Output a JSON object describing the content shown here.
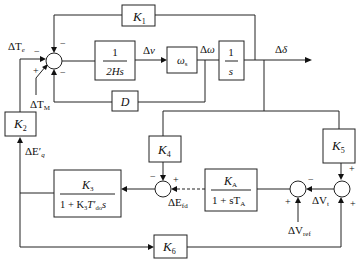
{
  "diagram": {
    "blocks": {
      "k1": {
        "label": "K",
        "sub": "1"
      },
      "inertia": {
        "num": "1",
        "den": "2Hs"
      },
      "omega_s": {
        "label": "ω",
        "sub": "s"
      },
      "integrator": {
        "num": "1",
        "den": "s"
      },
      "damping": {
        "label": "D"
      },
      "k2": {
        "label": "K",
        "sub": "2"
      },
      "k3": {
        "num": "K",
        "num_sub": "3",
        "den": "1 + K",
        "den_sub": "3",
        "den_rest": "T′",
        "den_sub2": "do",
        "den_s": "s"
      },
      "k4": {
        "label": "K",
        "sub": "4"
      },
      "ka": {
        "num": "K",
        "num_sub": "A",
        "den": "1 + sT",
        "den_sub": "A"
      },
      "k5": {
        "label": "K",
        "sub": "5"
      },
      "k6": {
        "label": "K",
        "sub": "6"
      }
    },
    "signals": {
      "delta_te": {
        "pre": "ΔT",
        "sub": "e"
      },
      "delta_tm": {
        "pre": "ΔT",
        "sub": "M"
      },
      "delta_v": {
        "pre": "Δ",
        "it": "v"
      },
      "delta_omega": {
        "pre": "Δ",
        "it": "ω"
      },
      "delta_delta": {
        "pre": "Δ",
        "it": "δ"
      },
      "delta_eq": {
        "pre": "ΔE′",
        "sub": "q"
      },
      "delta_efd": {
        "pre": "ΔE",
        "sub": "fd"
      },
      "delta_vt": {
        "pre": "ΔV",
        "sub": "t"
      },
      "delta_vref": {
        "pre": "ΔV",
        "sub": "ref"
      }
    },
    "signs": {
      "minus": "−",
      "plus": "+"
    }
  }
}
